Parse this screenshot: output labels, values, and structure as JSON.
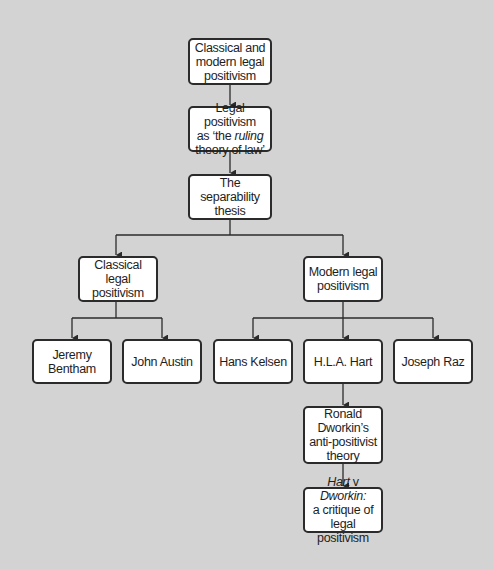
{
  "diagram": {
    "type": "hierarchy-flowchart",
    "background_color": "#d3d3d3",
    "node_fill": "#ffffff",
    "node_border_color": "#2b2b2b",
    "nodes": {
      "root": {
        "lines": [
          "Classical and",
          "modern legal",
          "positivism"
        ]
      },
      "ruling": {
        "line1": "Legal positivism",
        "line2_pre": "as ‘the ",
        "line2_em": "ruling",
        "line3": "theory of law’"
      },
      "separability": {
        "lines": [
          "The separability",
          "thesis"
        ]
      },
      "classical": {
        "lines": [
          "Classical legal",
          "positivism"
        ]
      },
      "modern": {
        "lines": [
          "Modern legal",
          "positivism"
        ]
      },
      "bentham": {
        "lines": [
          "Jeremy",
          "Bentham"
        ]
      },
      "austin": {
        "lines": [
          "John Austin"
        ]
      },
      "kelsen": {
        "lines": [
          "Hans Kelsen"
        ]
      },
      "hart": {
        "lines": [
          "H.L.A. Hart"
        ]
      },
      "raz": {
        "lines": [
          "Joseph Raz"
        ]
      },
      "dworkin": {
        "lines": [
          "Ronald",
          "Dworkin’s",
          "anti-positivist",
          "theory"
        ]
      },
      "hart_v_dworkin": {
        "line1_em1": "Hart",
        "line1_mid": " v ",
        "line1_em2": "Dworkin:",
        "line2": "a critique of",
        "line3": "legal positivism"
      }
    },
    "edges": [
      [
        "root",
        "ruling"
      ],
      [
        "ruling",
        "separability"
      ],
      [
        "separability",
        "classical"
      ],
      [
        "separability",
        "modern"
      ],
      [
        "classical",
        "bentham"
      ],
      [
        "classical",
        "austin"
      ],
      [
        "modern",
        "kelsen"
      ],
      [
        "modern",
        "hart"
      ],
      [
        "modern",
        "raz"
      ],
      [
        "hart",
        "dworkin"
      ],
      [
        "dworkin",
        "hart_v_dworkin"
      ]
    ]
  }
}
